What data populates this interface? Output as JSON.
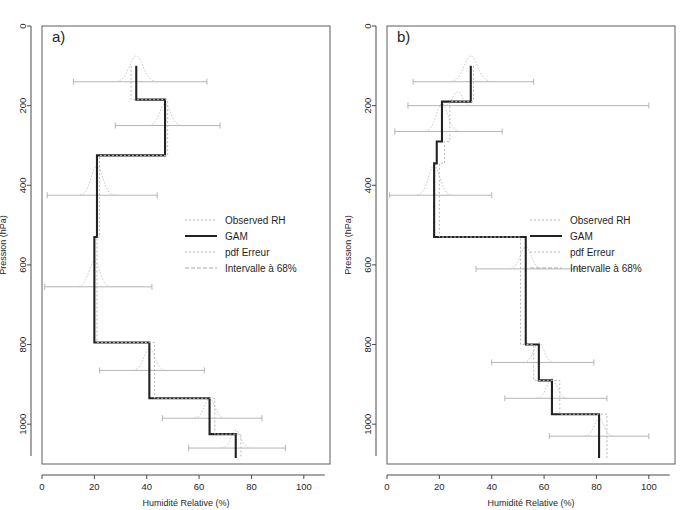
{
  "figure": {
    "width": 690,
    "height": 510,
    "background": "#ffffff"
  },
  "chart_data": [
    {
      "type": "line",
      "panel_label": "a)",
      "title": "",
      "xlabel": "Humidité Relative (%)",
      "ylabel": "Pression (hPa)",
      "xlim": [
        0,
        110
      ],
      "ylim": [
        0,
        1100
      ],
      "y_inverted": true,
      "grid": false,
      "xticks": [
        0,
        20,
        40,
        60,
        80,
        100
      ],
      "xtick_labels": [
        "0",
        "20",
        "40",
        "60",
        "80",
        "100"
      ],
      "yticks": [
        0,
        200,
        400,
        600,
        800,
        1000
      ],
      "ytick_labels": [
        "0",
        "200",
        "400",
        "600",
        "800",
        "1000"
      ],
      "legend_position": "center-right",
      "legend": [
        {
          "label": "Observed RH",
          "style": "dotted",
          "color": "#b9b9b9"
        },
        {
          "label": "GAM",
          "style": "solid",
          "color": "#222222"
        },
        {
          "label": "pdf Erreur",
          "style": "dotted-fine",
          "color": "#c4c4c4"
        },
        {
          "label": "Intervalle à 68%",
          "style": "dashed",
          "color": "#a8a8a8"
        }
      ],
      "series": [
        {
          "name": "GAM",
          "style": "step",
          "points": [
            {
              "rh": 36,
              "p": 100
            },
            {
              "rh": 36,
              "p": 185
            },
            {
              "rh": 47,
              "p": 185
            },
            {
              "rh": 47,
              "p": 325
            },
            {
              "rh": 21,
              "p": 325
            },
            {
              "rh": 21,
              "p": 530
            },
            {
              "rh": 20,
              "p": 530
            },
            {
              "rh": 20,
              "p": 795
            },
            {
              "rh": 41,
              "p": 795
            },
            {
              "rh": 41,
              "p": 935
            },
            {
              "rh": 64,
              "p": 935
            },
            {
              "rh": 64,
              "p": 1025
            },
            {
              "rh": 74,
              "p": 1025
            },
            {
              "rh": 74,
              "p": 1085
            }
          ]
        },
        {
          "name": "Observed RH",
          "style": "step-dotted",
          "points": [
            {
              "rh": 34,
              "p": 100
            },
            {
              "rh": 34,
              "p": 185
            },
            {
              "rh": 48,
              "p": 185
            },
            {
              "rh": 48,
              "p": 325
            },
            {
              "rh": 22,
              "p": 325
            },
            {
              "rh": 22,
              "p": 530
            },
            {
              "rh": 21,
              "p": 530
            },
            {
              "rh": 21,
              "p": 795
            },
            {
              "rh": 43,
              "p": 795
            },
            {
              "rh": 43,
              "p": 935
            },
            {
              "rh": 66,
              "p": 935
            },
            {
              "rh": 66,
              "p": 1025
            },
            {
              "rh": 76,
              "p": 1025
            },
            {
              "rh": 76,
              "p": 1085
            }
          ]
        }
      ],
      "error_levels": [
        {
          "p": 140,
          "center": 36,
          "lo": 12,
          "hi": 63,
          "pdf_height": 26,
          "pdf_width": 20
        },
        {
          "p": 250,
          "center": 47,
          "lo": 28,
          "hi": 68,
          "pdf_height": 22,
          "pdf_width": 16
        },
        {
          "p": 425,
          "center": 21,
          "lo": 2,
          "hi": 44,
          "pdf_height": 30,
          "pdf_width": 17
        },
        {
          "p": 655,
          "center": 20,
          "lo": 1,
          "hi": 42,
          "pdf_height": 26,
          "pdf_width": 16
        },
        {
          "p": 865,
          "center": 41,
          "lo": 22,
          "hi": 62,
          "pdf_height": 22,
          "pdf_width": 16
        },
        {
          "p": 985,
          "center": 64,
          "lo": 46,
          "hi": 84,
          "pdf_height": 20,
          "pdf_width": 15
        },
        {
          "p": 1060,
          "center": 74,
          "lo": 56,
          "hi": 93,
          "pdf_height": 18,
          "pdf_width": 14
        }
      ]
    },
    {
      "type": "line",
      "panel_label": "b)",
      "title": "",
      "xlabel": "Humidité Relative (%)",
      "ylabel": "Pression (hPa)",
      "xlim": [
        0,
        110
      ],
      "ylim": [
        0,
        1100
      ],
      "y_inverted": true,
      "grid": false,
      "xticks": [
        0,
        20,
        40,
        60,
        80,
        100
      ],
      "xtick_labels": [
        "0",
        "20",
        "40",
        "60",
        "80",
        "100"
      ],
      "yticks": [
        0,
        200,
        400,
        600,
        800,
        1000
      ],
      "ytick_labels": [
        "0",
        "200",
        "400",
        "600",
        "800",
        "1000"
      ],
      "legend_position": "center-right",
      "legend": [
        {
          "label": "Observed RH",
          "style": "dotted",
          "color": "#b9b9b9"
        },
        {
          "label": "GAM",
          "style": "solid",
          "color": "#222222"
        },
        {
          "label": "pdf Erreur",
          "style": "dotted-fine",
          "color": "#c4c4c4"
        },
        {
          "label": "Intervalle à 68%",
          "style": "dashed",
          "color": "#a8a8a8"
        }
      ],
      "series": [
        {
          "name": "GAM",
          "style": "step",
          "points": [
            {
              "rh": 32,
              "p": 100
            },
            {
              "rh": 32,
              "p": 190
            },
            {
              "rh": 21,
              "p": 190
            },
            {
              "rh": 21,
              "p": 290
            },
            {
              "rh": 19,
              "p": 290
            },
            {
              "rh": 19,
              "p": 345
            },
            {
              "rh": 18,
              "p": 345
            },
            {
              "rh": 18,
              "p": 530
            },
            {
              "rh": 53,
              "p": 530
            },
            {
              "rh": 53,
              "p": 800
            },
            {
              "rh": 58,
              "p": 800
            },
            {
              "rh": 58,
              "p": 890
            },
            {
              "rh": 63,
              "p": 890
            },
            {
              "rh": 63,
              "p": 975
            },
            {
              "rh": 81,
              "p": 975
            },
            {
              "rh": 81,
              "p": 1085
            }
          ]
        },
        {
          "name": "Observed RH",
          "style": "step-dotted",
          "points": [
            {
              "rh": 33,
              "p": 100
            },
            {
              "rh": 33,
              "p": 190
            },
            {
              "rh": 24,
              "p": 190
            },
            {
              "rh": 24,
              "p": 290
            },
            {
              "rh": 22,
              "p": 290
            },
            {
              "rh": 22,
              "p": 345
            },
            {
              "rh": 20,
              "p": 345
            },
            {
              "rh": 20,
              "p": 530
            },
            {
              "rh": 51,
              "p": 530
            },
            {
              "rh": 51,
              "p": 800
            },
            {
              "rh": 56,
              "p": 800
            },
            {
              "rh": 56,
              "p": 890
            },
            {
              "rh": 66,
              "p": 890
            },
            {
              "rh": 66,
              "p": 975
            },
            {
              "rh": 84,
              "p": 975
            },
            {
              "rh": 84,
              "p": 1085
            }
          ]
        }
      ],
      "error_levels": [
        {
          "p": 140,
          "center": 32,
          "lo": 10,
          "hi": 56,
          "pdf_height": 26,
          "pdf_width": 20
        },
        {
          "p": 200,
          "center": 27,
          "lo": 8,
          "hi": 100,
          "pdf_height": 14,
          "pdf_width": 14
        },
        {
          "p": 265,
          "center": 21,
          "lo": 3,
          "hi": 44,
          "pdf_height": 28,
          "pdf_width": 17
        },
        {
          "p": 425,
          "center": 18,
          "lo": 1,
          "hi": 40,
          "pdf_height": 30,
          "pdf_width": 17
        },
        {
          "p": 610,
          "center": 53,
          "lo": 34,
          "hi": 74,
          "pdf_height": 22,
          "pdf_width": 16
        },
        {
          "p": 845,
          "center": 58,
          "lo": 40,
          "hi": 79,
          "pdf_height": 20,
          "pdf_width": 15
        },
        {
          "p": 935,
          "center": 63,
          "lo": 45,
          "hi": 84,
          "pdf_height": 20,
          "pdf_width": 15
        },
        {
          "p": 1030,
          "center": 81,
          "lo": 62,
          "hi": 100,
          "pdf_height": 18,
          "pdf_width": 14
        }
      ]
    }
  ]
}
